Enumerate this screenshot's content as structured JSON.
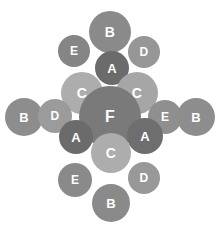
{
  "diagram": {
    "background_color": "#ffffff",
    "width": 216,
    "height": 227,
    "label_color": "#ffffff",
    "legend_colors": {
      "A": "#6e6e6e",
      "B": "#8f8f8f",
      "C": "#a9a9a9",
      "D": "#9a9a9a",
      "E": "#8a8a8a",
      "F": "#7c7c7c"
    }
  },
  "chart_data": {
    "type": "scatter",
    "xlabel": "",
    "ylabel": "",
    "xlim": [
      0,
      216
    ],
    "ylim": [
      0,
      227
    ],
    "grid": false,
    "legend": "none",
    "categories": [
      "A",
      "B",
      "C",
      "D",
      "E",
      "F"
    ],
    "nodes": [
      {
        "label": "B",
        "cx": 110,
        "cy": 32,
        "r": 21,
        "color": "#8a8a8a",
        "font": 14
      },
      {
        "label": "E",
        "cx": 74,
        "cy": 51,
        "r": 16,
        "color": "#858585",
        "font": 12
      },
      {
        "label": "D",
        "cx": 144,
        "cy": 52,
        "r": 16,
        "color": "#969696",
        "font": 12
      },
      {
        "label": "A",
        "cx": 112,
        "cy": 68,
        "r": 17,
        "color": "#6b6b6b",
        "font": 13
      },
      {
        "label": "C",
        "cx": 82,
        "cy": 93,
        "r": 21,
        "color": "#adadad",
        "font": 14
      },
      {
        "label": "C",
        "cx": 137,
        "cy": 93,
        "r": 21,
        "color": "#a6a6a6",
        "font": 14
      },
      {
        "label": "B",
        "cx": 24,
        "cy": 117,
        "r": 19,
        "color": "#8d8d8d",
        "font": 13
      },
      {
        "label": "D",
        "cx": 55,
        "cy": 116,
        "r": 17,
        "color": "#9b9b9b",
        "font": 12
      },
      {
        "label": "F",
        "cx": 110,
        "cy": 117,
        "r": 31,
        "color": "#7a7a7a",
        "font": 16
      },
      {
        "label": "E",
        "cx": 165,
        "cy": 117,
        "r": 17,
        "color": "#8f8f8f",
        "font": 12
      },
      {
        "label": "B",
        "cx": 196,
        "cy": 117,
        "r": 19,
        "color": "#8d8d8d",
        "font": 13
      },
      {
        "label": "A",
        "cx": 76,
        "cy": 137,
        "r": 17,
        "color": "#6b6b6b",
        "font": 13
      },
      {
        "label": "A",
        "cx": 145,
        "cy": 136,
        "r": 18,
        "color": "#6e6e6e",
        "font": 13
      },
      {
        "label": "C",
        "cx": 111,
        "cy": 153,
        "r": 20,
        "color": "#adadad",
        "font": 14
      },
      {
        "label": "E",
        "cx": 75,
        "cy": 180,
        "r": 17,
        "color": "#8a8a8a",
        "font": 12
      },
      {
        "label": "D",
        "cx": 144,
        "cy": 178,
        "r": 16,
        "color": "#989898",
        "font": 12
      },
      {
        "label": "B",
        "cx": 111,
        "cy": 203,
        "r": 19,
        "color": "#8a8a8a",
        "font": 13
      }
    ]
  }
}
